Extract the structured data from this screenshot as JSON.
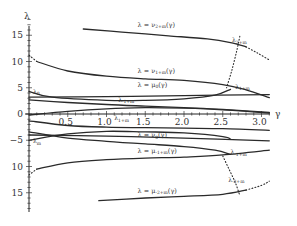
{
  "chart_data": {
    "type": "line",
    "title": "",
    "xlabel": "γ",
    "ylabel": "λ",
    "xlim": [
      0,
      3.14
    ],
    "ylim": [
      -18,
      18
    ],
    "grid": false,
    "x_ticks": [
      "0.5",
      "1.0",
      "1.5",
      "2.0",
      "2.5",
      "3.0"
    ],
    "x_tick_values": [
      0.5,
      1.0,
      1.5,
      2.0,
      2.5,
      3.0
    ],
    "y_ticks": [
      "15",
      "10",
      "5",
      "0",
      "−5",
      "10",
      "15"
    ],
    "y_tick_values": [
      15,
      10,
      5,
      0,
      -5,
      -10,
      -15
    ],
    "origin_label": "0",
    "series": [
      {
        "name": "λ = ν_{2+m}(γ)",
        "style": "solid",
        "x": [
          0.7,
          1.2,
          1.8,
          2.3,
          2.6,
          2.8
        ],
        "values": [
          16.2,
          15.6,
          14.9,
          14.3,
          13.6,
          12.8
        ]
      },
      {
        "name": "λ = ν_{2+m}(γ) dotted tail",
        "style": "dotted",
        "x": [
          2.8,
          2.95,
          3.1
        ],
        "values": [
          12.8,
          11.6,
          10.3
        ]
      },
      {
        "name": "λ = ν_{1+m}(γ)",
        "style": "solid",
        "x": [
          0.1,
          0.5,
          1.0,
          1.5,
          2.0,
          2.5,
          2.8,
          3.1
        ],
        "values": [
          10.0,
          8.2,
          7.2,
          6.7,
          6.4,
          5.6,
          4.6,
          3.1
        ]
      },
      {
        "name": "λ = ν_{1+m}(γ) dotted start",
        "style": "dotted",
        "x": [
          0.0,
          0.1
        ],
        "values": [
          11.2,
          10.0
        ]
      },
      {
        "name": "λ = μ_0(γ)",
        "style": "solid",
        "x": [
          0.0,
          0.3,
          1.0,
          1.5,
          2.0,
          2.4,
          2.6
        ],
        "values": [
          4.3,
          3.2,
          2.6,
          2.6,
          2.9,
          3.6,
          4.7
        ]
      },
      {
        "name": "λ_0 line",
        "style": "solid",
        "x": [
          0.0,
          1.0,
          2.0,
          3.1
        ],
        "values": [
          3.2,
          3.3,
          3.5,
          3.7
        ]
      },
      {
        "name": "λ_{-1+m} branch",
        "style": "solid",
        "x": [
          0.0,
          0.5,
          1.0,
          1.5,
          2.0,
          2.5,
          3.1
        ],
        "values": [
          2.7,
          2.2,
          1.8,
          1.5,
          1.2,
          0.9,
          0.3
        ]
      },
      {
        "name": "λ_{1+m} branch",
        "style": "solid",
        "x": [
          0.0,
          0.5,
          1.0,
          1.5,
          2.0,
          2.5,
          3.1
        ],
        "values": [
          -0.2,
          0.5,
          1.0,
          1.2,
          1.1,
          0.8,
          0.2
        ]
      },
      {
        "name": "λ = ν_0(γ)",
        "style": "solid",
        "x": [
          0.0,
          0.5,
          1.0,
          1.5,
          2.0,
          2.5,
          3.1
        ],
        "values": [
          -1.3,
          -2.2,
          -2.5,
          -2.6,
          -2.7,
          -2.8,
          -3.1
        ]
      },
      {
        "name": "λ_m line",
        "style": "solid",
        "x": [
          0.0,
          1.0,
          2.0,
          3.1
        ],
        "values": [
          -4.0,
          -4.2,
          -4.6,
          -5.1
        ]
      },
      {
        "name": "λ_m branch",
        "style": "solid",
        "x": [
          0.0,
          0.5,
          1.0,
          1.5,
          2.0,
          2.5,
          2.6
        ],
        "values": [
          -5.0,
          -3.8,
          -3.3,
          -3.4,
          -3.6,
          -4.3,
          -4.8
        ]
      },
      {
        "name": "λ = ν_0(γ) lower",
        "style": "solid",
        "x": [
          0.0,
          0.5,
          1.0,
          1.5,
          2.0,
          2.4,
          2.6
        ],
        "values": [
          -3.4,
          -4.6,
          -5.2,
          -5.7,
          -6.2,
          -6.9,
          -7.7
        ]
      },
      {
        "name": "λ = μ_{-1+m}(γ)",
        "style": "solid",
        "x": [
          0.1,
          0.5,
          1.0,
          1.5,
          2.0,
          2.5,
          3.1
        ],
        "values": [
          -10.5,
          -9.3,
          -8.7,
          -8.4,
          -8.2,
          -7.8,
          -6.9
        ]
      },
      {
        "name": "λ = μ_{-1+m}(γ) dotted start",
        "style": "dotted",
        "x": [
          0.0,
          0.1
        ],
        "values": [
          -11.6,
          -10.5
        ]
      },
      {
        "name": "λ = μ_{-2+m}(γ)",
        "style": "solid",
        "x": [
          0.9,
          1.5,
          2.0,
          2.5,
          2.8
        ],
        "values": [
          -16.5,
          -16.0,
          -15.7,
          -15.3,
          -14.5
        ]
      },
      {
        "name": "λ = μ_{-2+m}(γ) dotted tail",
        "style": "dotted",
        "x": [
          2.8,
          3.0,
          3.1
        ],
        "values": [
          -14.5,
          -13.6,
          -12.8
        ]
      },
      {
        "name": "upper dotted locus (λ_{2+m}→λ_{1+m})",
        "style": "dotted",
        "x": [
          2.72,
          2.68,
          2.62,
          2.55
        ],
        "values": [
          14.8,
          12.0,
          8.5,
          5.0
        ]
      },
      {
        "name": "lower dotted locus (λ_{-1+m}→λ_{-2+m})",
        "style": "dotted",
        "x": [
          2.5,
          2.58,
          2.66,
          2.72
        ],
        "values": [
          -8.0,
          -10.5,
          -13.0,
          -15.5
        ]
      }
    ],
    "annotations": [
      {
        "text": "λ = ν",
        "sub": "2+m",
        "suffix": "(γ)",
        "x": 1.4,
        "y": 16.6
      },
      {
        "text": "λ",
        "sub": "2+m",
        "suffix": "",
        "x": 2.62,
        "y": 13.7
      },
      {
        "text": "λ = ν",
        "sub": "1+m",
        "suffix": "(γ)",
        "x": 1.4,
        "y": 7.9
      },
      {
        "text": "λ",
        "sub": "1+m",
        "suffix": "",
        "x": 2.66,
        "y": 4.8
      },
      {
        "text": "λ = μ",
        "sub": "0",
        "suffix": "(γ)",
        "x": 1.4,
        "y": 5.2
      },
      {
        "text": "λ",
        "sub": "0",
        "suffix": "",
        "x": 0.05,
        "y": 3.9
      },
      {
        "text": "λ",
        "sub": "-1+m",
        "suffix": "",
        "x": 1.15,
        "y": 2.3
      },
      {
        "text": "λ",
        "sub": "1+m",
        "suffix": "",
        "x": 1.1,
        "y": -1.2
      },
      {
        "text": "λ",
        "sub": "m",
        "suffix": "",
        "x": 0.05,
        "y": -5.6
      },
      {
        "text": "λ = ν",
        "sub": "0",
        "suffix": "(γ)",
        "x": 1.4,
        "y": -4.4
      },
      {
        "text": "λ",
        "sub": "-1+m",
        "suffix": "",
        "x": 2.6,
        "y": -7.7
      },
      {
        "text": "λ = μ",
        "sub": "-1+m",
        "suffix": "(γ)",
        "x": 1.4,
        "y": -7.4
      },
      {
        "text": "λ",
        "sub": "-2+m",
        "suffix": "",
        "x": 2.57,
        "y": -12.9
      },
      {
        "text": "λ = μ",
        "sub": "-2+m",
        "suffix": "(γ)",
        "x": 1.4,
        "y": -15.0
      }
    ]
  }
}
